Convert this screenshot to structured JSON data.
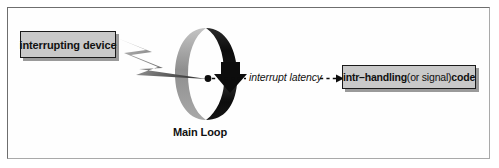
{
  "figure": {
    "title_alt": "interrupt handling main loop diagram",
    "background_color": "#ffffff",
    "frame_color": "#6e6e6e"
  },
  "nodes": {
    "device_box": {
      "label": "interrupting device",
      "fill": "#c9c9c9",
      "border": "#1a1a1a"
    },
    "handler_box": {
      "label_part_1": "intr–handling",
      "label_part_2": " (or signal) ",
      "label_part_3": "code",
      "fill": "#c9c9c9",
      "border": "#1a1a1a"
    }
  },
  "labels": {
    "main_loop": "Main Loop",
    "interrupt_latency": "interrupt latency"
  },
  "shapes": {
    "loop_ellipse": {
      "left_half_color": "#9a9a9a",
      "right_half_color": "#111111",
      "arrowhead_color": "#111111"
    },
    "interrupt_bolt": {
      "color_dark": "#4d4d4d",
      "color_light": "#bdbdbd"
    },
    "latency_connector": {
      "style": "dashed",
      "color": "#111111"
    },
    "junction_dot": {
      "color": "#111111"
    }
  }
}
